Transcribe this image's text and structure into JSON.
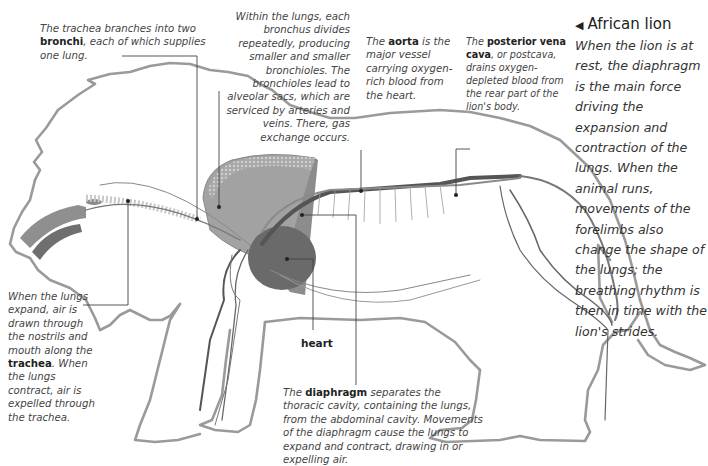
{
  "title": {
    "arrow_icon": "◀",
    "text": "African lion"
  },
  "caption": "When the lion is at rest, the diaphragm is the main force driving the expansion and contraction of the lungs. When the animal runs, movements of the forelimbs also change the shape of the lungs; the breathing rhythm is then in time with the lion's strides.",
  "annotations": {
    "bronchi": {
      "pre": "The trachea branches into two ",
      "term": "bronchi",
      "post": ", each of which supplies one lung."
    },
    "lungs": {
      "text": "Within the lungs, each bronchus divides repeatedly, producing smaller and smaller bronchioles. The bronchioles lead to alveolar sacs, which are serviced by arteries and veins. There, gas exchange occurs."
    },
    "aorta": {
      "pre": "The ",
      "term": "aorta",
      "post": " is the major vessel carrying oxygen-rich blood from the heart."
    },
    "vena_cava": {
      "pre": "The ",
      "term": "posterior vena cava",
      "post": ", or postcava, drains oxygen-depleted blood from the rear part of the lion's body."
    },
    "trachea": {
      "pre": "When the lungs expand, air is drawn through the nostrils and mouth along the ",
      "term": "trachea",
      "post": ". When the lungs contract, air is expelled through the trachea."
    },
    "heart": {
      "label": "heart"
    },
    "diaphragm": {
      "pre": "The ",
      "term": "diaphragm",
      "post": "  separates the thoracic cavity, containing the lungs, from the abdominal cavity. Movements of the diaphragm cause the lungs to expand and contract, drawing in or expelling air."
    }
  },
  "colors": {
    "outline": "#9a9a9a",
    "vessel": "#555555",
    "lung": "#9e9e9e",
    "heart": "#6a6a6a",
    "diaphragm": "#8c8c8c",
    "leader": "#444444"
  }
}
